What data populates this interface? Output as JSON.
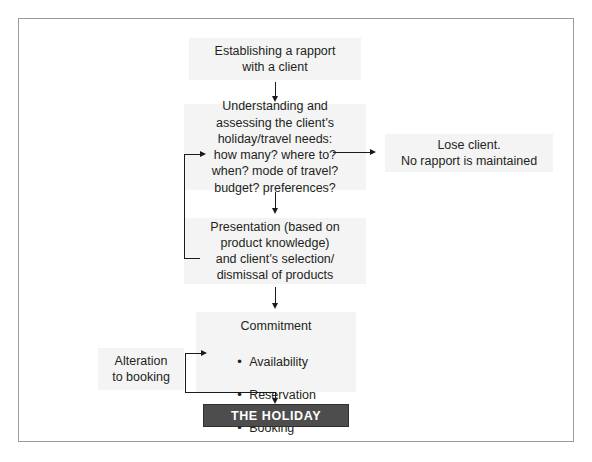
{
  "figure": {
    "kind": "flowchart",
    "title_visible": false,
    "border_color": "#9a9a9a",
    "node_fill": "#f4f4f4",
    "terminal_fill": "#4d4d4d",
    "terminal_text_color": "#ffffff",
    "connector_color": "#1a1a1a"
  },
  "nodes": {
    "rapport": {
      "text": "Establishing a rapport\nwith a client"
    },
    "needs": {
      "text": "Understanding and\nassessing the client’s\nholiday/travel needs:\nhow many? where to?\nwhen? mode of travel?\nbudget? preferences?"
    },
    "lose_client": {
      "text": "Lose client.\nNo rapport is maintained"
    },
    "presentation": {
      "text": "Presentation (based on\nproduct knowledge)\nand client’s selection/\ndismissal of products"
    },
    "commitment": {
      "heading": "Commitment",
      "items": [
        "Availability",
        "Reservation",
        "Booking"
      ]
    },
    "alteration": {
      "text": "Alteration\nto booking"
    },
    "holiday": {
      "text": "THE HOLIDAY"
    }
  },
  "connectors": [
    {
      "name": "rapport-to-needs",
      "from": "rapport",
      "to": "needs",
      "direction": "down"
    },
    {
      "name": "needs-to-lose-client",
      "from": "needs",
      "to": "lose_client",
      "direction": "right"
    },
    {
      "name": "needs-to-presentation",
      "from": "needs",
      "to": "presentation",
      "direction": "down"
    },
    {
      "name": "presentation-back-to-needs",
      "from": "presentation",
      "to": "needs",
      "direction": "loop-left-up"
    },
    {
      "name": "presentation-to-commitment",
      "from": "presentation",
      "to": "commitment",
      "direction": "down"
    },
    {
      "name": "commitment-to-holiday",
      "from": "commitment",
      "to": "holiday",
      "direction": "down"
    },
    {
      "name": "booking-back-to-commitment",
      "from": "holiday",
      "to": "commitment",
      "direction": "loop-left-up"
    }
  ]
}
